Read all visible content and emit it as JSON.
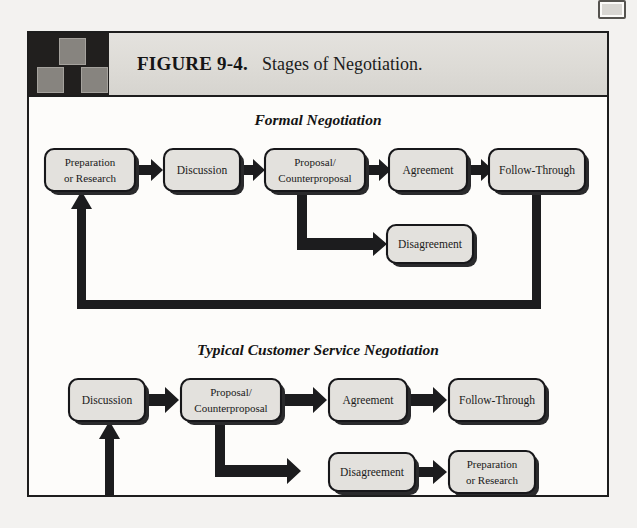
{
  "page": {
    "background_color": "#f3f2f0",
    "frame_border_color": "#1d1d1d"
  },
  "header": {
    "figure_label": "FIGURE 9-4.",
    "caption": "Stages of Negotiation.",
    "logo_name": "three-squares-logo",
    "bar_color": "#dedcd8",
    "logo_bg_color": "#211f1e"
  },
  "diagram": {
    "type": "flowchart",
    "sections": [
      {
        "id": "formal",
        "title": "Formal Negotiation",
        "nodes": [
          {
            "id": "f-prep",
            "label_lines": [
              "Preparation",
              "or  Research"
            ],
            "x": 16,
            "y": 52,
            "w": 90,
            "h": 42
          },
          {
            "id": "f-disc",
            "label_lines": [
              "Discussion"
            ],
            "x": 135,
            "y": 52,
            "w": 76,
            "h": 42
          },
          {
            "id": "f-prop",
            "label_lines": [
              "Proposal/",
              "Counterproposal"
            ],
            "x": 236,
            "y": 52,
            "w": 100,
            "h": 42
          },
          {
            "id": "f-agree",
            "label_lines": [
              "Agreement"
            ],
            "x": 360,
            "y": 52,
            "w": 78,
            "h": 42
          },
          {
            "id": "f-follow",
            "label_lines": [
              "Follow-Through"
            ],
            "x": 460,
            "y": 52,
            "w": 96,
            "h": 42
          },
          {
            "id": "f-disagree",
            "label_lines": [
              "Disagreement"
            ],
            "x": 358,
            "y": 128,
            "w": 86,
            "h": 38
          }
        ],
        "edges": [
          {
            "from": "f-prep",
            "to": "f-disc",
            "kind": "arrow-right"
          },
          {
            "from": "f-disc",
            "to": "f-prop",
            "kind": "arrow-right"
          },
          {
            "from": "f-prop",
            "to": "f-agree",
            "kind": "arrow-right"
          },
          {
            "from": "f-agree",
            "to": "f-follow",
            "kind": "arrow-right"
          },
          {
            "from": "f-prop",
            "to": "f-disagree",
            "kind": "elbow-down-right"
          },
          {
            "from": "f-follow",
            "to": "f-prep",
            "kind": "feedback-loop"
          }
        ]
      },
      {
        "id": "typical",
        "title": "Typical Customer Service Negotiation",
        "nodes": [
          {
            "id": "t-disc",
            "label_lines": [
              "Discussion"
            ],
            "x": 40,
            "y": 282,
            "w": 76,
            "h": 42
          },
          {
            "id": "t-prop",
            "label_lines": [
              "Proposal/",
              "Counterproposal"
            ],
            "x": 152,
            "y": 282,
            "w": 100,
            "h": 42
          },
          {
            "id": "t-agree",
            "label_lines": [
              "Agreement"
            ],
            "x": 300,
            "y": 282,
            "w": 78,
            "h": 42
          },
          {
            "id": "t-follow",
            "label_lines": [
              "Follow-Through"
            ],
            "x": 420,
            "y": 282,
            "w": 96,
            "h": 42
          },
          {
            "id": "t-disagree",
            "label_lines": [
              "Disagreement"
            ],
            "x": 300,
            "y": 356,
            "w": 86,
            "h": 38
          },
          {
            "id": "t-prep",
            "label_lines": [
              "Preparation",
              "or  Research"
            ],
            "x": 420,
            "y": 354,
            "w": 86,
            "h": 42
          }
        ],
        "edges": [
          {
            "from": "t-disc",
            "to": "t-prop",
            "kind": "arrow-right"
          },
          {
            "from": "t-prop",
            "to": "t-agree",
            "kind": "arrow-right"
          },
          {
            "from": "t-agree",
            "to": "t-follow",
            "kind": "arrow-right"
          },
          {
            "from": "t-prop",
            "to": "t-disagree",
            "kind": "elbow-down-right"
          },
          {
            "from": "t-disagree",
            "to": "t-prep",
            "kind": "arrow-right"
          },
          {
            "from": "t-prep",
            "to": "t-disc",
            "kind": "feedback-loop"
          }
        ]
      }
    ],
    "colors": {
      "box_fill": "#e3e1dd",
      "box_stroke": "#17171a",
      "box_shadow": "#2a2a2c",
      "connector": "#1c1c1e"
    }
  }
}
